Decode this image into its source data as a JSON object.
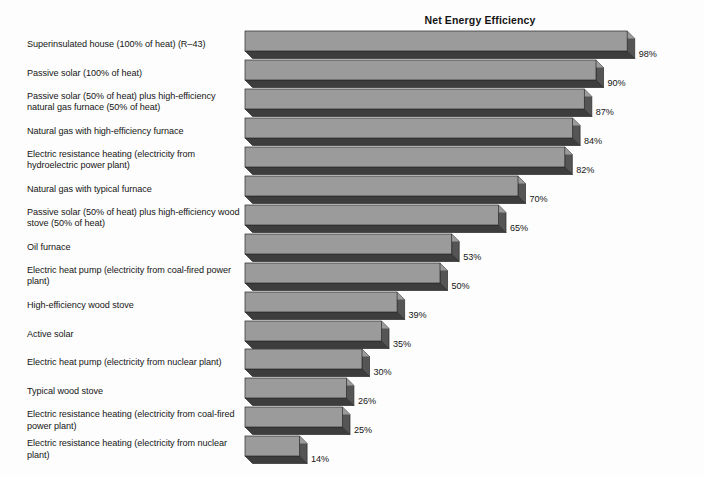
{
  "chart_data": {
    "type": "bar",
    "orientation": "horizontal",
    "title": "Net Energy Efficiency",
    "xlabel": "",
    "ylabel": "",
    "xlim": [
      0,
      100
    ],
    "grid": false,
    "legend": "none",
    "value_suffix": "%",
    "categories": [
      "Superinsulated house (100% of heat) (R–43)",
      "Passive solar (100% of heat)",
      "Passive solar (50% of heat) plus high-efficiency natural gas furnace (50% of heat)",
      "Natural gas with high-efficiency furnace",
      "Electric resistance heating (electricity from hydroelectric power plant)",
      "Natural gas with typical furnace",
      "Passive solar (50% of heat) plus high-efficiency wood stove (50% of heat)",
      "Oil furnace",
      "Electric heat pump (electricity from coal-fired power plant)",
      "High-efficiency wood stove",
      "Active solar",
      "Electric heat pump (electricity from nuclear plant)",
      "Typical wood stove",
      "Electric resistance heating (electricity from coal-fired power plant)",
      "Electric resistance heating (electricity from nuclear plant)"
    ],
    "values": [
      98,
      90,
      87,
      84,
      82,
      70,
      65,
      53,
      50,
      39,
      35,
      30,
      26,
      25,
      14
    ],
    "value_labels": [
      "98%",
      "90%",
      "87%",
      "84%",
      "82%",
      "70%",
      "65%",
      "53%",
      "50%",
      "39%",
      "35%",
      "30%",
      "26%",
      "25%",
      "14%"
    ],
    "colors": {
      "bar_face": "#9b9b9b",
      "bar_shadow": "#3d3d3d",
      "bar_side": "#555555",
      "bar_outline": "#2a2a2a",
      "background": "#fdfdfd",
      "text": "#151515"
    }
  }
}
